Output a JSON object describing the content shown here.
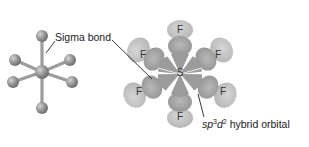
{
  "figure": {
    "colors": {
      "background": "#ffffff",
      "ball": "#8a8a8a",
      "ball_highlight": "#c9c9c9",
      "stick": "#9a9a9a",
      "orbital_inner": "#a8a8a8",
      "orbital_outer": "#c4c4c4",
      "leader_line": "#222222"
    },
    "ball_and_stick": {
      "label": "Sigma bond"
    },
    "orbital_model": {
      "central_atom": "S",
      "ligands": [
        "F",
        "F",
        "F",
        "F",
        "F",
        "F"
      ],
      "hybrid_label": {
        "prefix": "sp",
        "sup1": "3",
        "mid": "d",
        "sup2": "2",
        "suffix": " hybrid orbital"
      }
    }
  }
}
